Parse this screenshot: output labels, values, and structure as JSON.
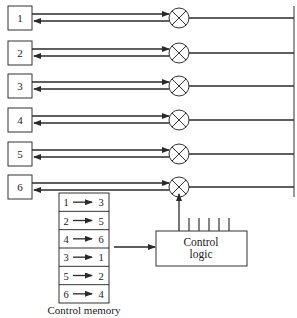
{
  "diagram": {
    "ports": [
      {
        "label": "1",
        "y": 18
      },
      {
        "label": "2",
        "y": 53
      },
      {
        "label": "3",
        "y": 86
      },
      {
        "label": "4",
        "y": 120
      },
      {
        "label": "5",
        "y": 154
      },
      {
        "label": "6",
        "y": 187
      }
    ],
    "control_memory": {
      "caption": "Control memory",
      "entries": [
        {
          "from": "1",
          "to": "3"
        },
        {
          "from": "2",
          "to": "5"
        },
        {
          "from": "4",
          "to": "6"
        },
        {
          "from": "3",
          "to": "1"
        },
        {
          "from": "5",
          "to": "2"
        },
        {
          "from": "6",
          "to": "4"
        }
      ]
    },
    "control_logic": {
      "line1": "Control",
      "line2": "logic"
    }
  },
  "colors": {
    "line": "#2a2a2a",
    "background": "#ffffff"
  }
}
